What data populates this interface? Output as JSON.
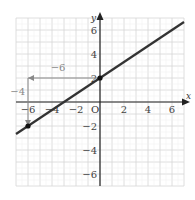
{
  "chart_data": {
    "type": "line",
    "title": "",
    "xlabel": "x",
    "ylabel": "y",
    "origin_label": "O",
    "xlim": [
      -7,
      7
    ],
    "ylim": [
      -7,
      7
    ],
    "grid": true,
    "x_ticks": [
      -6,
      -4,
      -2,
      2,
      4,
      6
    ],
    "y_ticks": [
      -6,
      -4,
      -2,
      2,
      4,
      6
    ],
    "x_tick_labels": [
      "−6",
      "−4",
      "−2",
      "2",
      "4",
      "6"
    ],
    "y_tick_labels": [
      "−6",
      "−4",
      "−2",
      "2",
      "4",
      "6"
    ],
    "series": [
      {
        "name": "line",
        "slope": 0.6667,
        "intercept": 2,
        "x": [
          -7,
          7
        ],
        "y": [
          -2.67,
          6.67
        ],
        "color": "#333333"
      }
    ],
    "points": [
      {
        "x": 0,
        "y": 2
      },
      {
        "x": -6,
        "y": -2
      }
    ],
    "annotations": [
      {
        "type": "arrow",
        "from": [
          0,
          2
        ],
        "to": [
          -6,
          2
        ],
        "label": "−6",
        "color": "#888888"
      },
      {
        "type": "arrow",
        "from": [
          -6,
          2
        ],
        "to": [
          -6,
          -2
        ],
        "label": "−4",
        "color": "#888888"
      }
    ]
  }
}
